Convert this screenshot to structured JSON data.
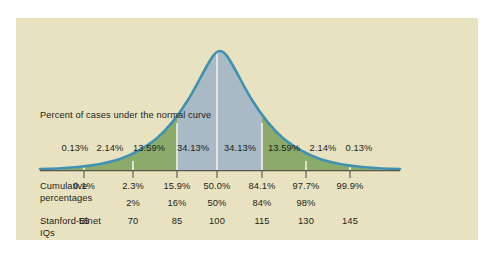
{
  "figure": {
    "background_color": "#e8e2c0",
    "caption": "Percent of cases under the\nnormal curve",
    "curve_stroke_color": "#3e92b0",
    "center_fill_color": "#a8bac6",
    "outer_fill_color": "#8aab6a",
    "divider_color": "#f2f2ea",
    "tick_color": "#5a5548",
    "text_color": "#1d1d1b"
  },
  "rows": {
    "cumulative_label": "Cumulative\npercentages",
    "iq_label": "Stanford-Binet\nIQs"
  },
  "chart_data": {
    "type": "area",
    "title": "Percent of cases under the normal curve",
    "xlabel": "Stanford-Binet IQs",
    "ylabel": "",
    "distribution": "normal",
    "mean": 100,
    "sd": 15,
    "xlim": [
      40,
      160
    ],
    "grid": false,
    "legend": null,
    "band_percents": [
      "0.13%",
      "2.14%",
      "13.59%",
      "34.13%",
      "34.13%",
      "13.59%",
      "2.14%",
      "0.13%"
    ],
    "band_percent_values": [
      0.13,
      2.14,
      13.59,
      34.13,
      34.13,
      13.59,
      2.14,
      0.13
    ],
    "band_x_centers": [
      59,
      94,
      133,
      177,
      224,
      268,
      307,
      343
    ],
    "band_fill": [
      "outer",
      "outer",
      "outer",
      "center",
      "center",
      "outer",
      "outer",
      "outer"
    ],
    "sigma_boundaries_x": [
      68,
      117,
      161,
      201,
      246,
      290,
      334
    ],
    "cumulative_percentages": [
      "0.1%",
      "2.3%",
      "15.9%",
      "50.0%",
      "84.1%",
      "97.7%",
      "99.9%"
    ],
    "cumulative_values": [
      0.1,
      2.3,
      15.9,
      50.0,
      84.1,
      97.7,
      99.9
    ],
    "rounded_percentages": [
      "2%",
      "16%",
      "50%",
      "84%",
      "98%"
    ],
    "rounded_values": [
      2,
      16,
      50,
      84,
      98
    ],
    "rounded_x": [
      117,
      161,
      201,
      246,
      290
    ],
    "iq_scores": [
      "55",
      "70",
      "85",
      "100",
      "115",
      "130",
      "145"
    ],
    "iq_values": [
      55,
      70,
      85,
      100,
      115,
      130,
      145
    ],
    "tick_x": [
      68,
      117,
      161,
      201,
      246,
      290,
      334
    ]
  }
}
